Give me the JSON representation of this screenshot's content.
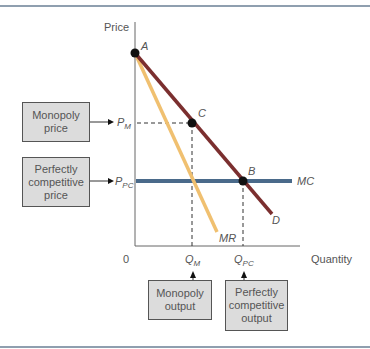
{
  "diagram": {
    "axes": {
      "y_label": "Price",
      "x_label": "Quantity",
      "origin_label": "0"
    },
    "points": {
      "a": "A",
      "b": "B",
      "c": "C"
    },
    "curves": {
      "demand": "D",
      "marginal_revenue": "MR",
      "marginal_cost": "MC"
    },
    "price_ticks": {
      "monopoly": "P",
      "monopoly_sub": "M",
      "competitive": "P",
      "competitive_sub": "PC"
    },
    "quantity_ticks": {
      "monopoly": "Q",
      "monopoly_sub": "M",
      "competitive": "Q",
      "competitive_sub": "PC"
    },
    "callouts": {
      "monopoly_price": "Monopoly\nprice",
      "competitive_price": "Perfectly\ncompetitive\nprice",
      "monopoly_output": "Monopoly\noutput",
      "competitive_output": "Perfectly\ncompetitive\noutput"
    },
    "colors": {
      "demand": "#7b2f2f",
      "marginal_revenue": "#f0c070",
      "marginal_cost": "#4a6a8a",
      "frame": "#6a7f94",
      "box_fill": "#dcdcdc"
    }
  }
}
